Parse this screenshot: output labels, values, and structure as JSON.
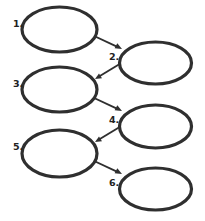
{
  "diagram": {
    "type": "flowchart",
    "background_color": "#ffffff",
    "shape_fill": "#ffffff",
    "shape_stroke": "#2f2f2f",
    "arrow_color": "#2f2f2f",
    "label_color": "#222222",
    "nodes": [
      {
        "id": "node-1",
        "label": "1.",
        "text": "",
        "cx": 59.5,
        "cy": 29.5,
        "rx": 37.5,
        "ry": 22.5,
        "label_x": 13,
        "label_y": 27,
        "column": "left"
      },
      {
        "id": "node-2",
        "label": "2.",
        "text": "",
        "cx": 155.5,
        "cy": 63.0,
        "rx": 36.0,
        "ry": 21.0,
        "label_x": 109,
        "label_y": 60,
        "column": "right"
      },
      {
        "id": "node-3",
        "label": "3.",
        "text": "",
        "cx": 59.5,
        "cy": 89.5,
        "rx": 37.5,
        "ry": 22.5,
        "label_x": 13,
        "label_y": 87,
        "column": "left"
      },
      {
        "id": "node-4",
        "label": "4.",
        "text": "",
        "cx": 155.5,
        "cy": 126.5,
        "rx": 36.0,
        "ry": 21.5,
        "label_x": 109,
        "label_y": 123,
        "column": "right"
      },
      {
        "id": "node-5",
        "label": "5.",
        "text": "",
        "cx": 59.5,
        "cy": 153.5,
        "rx": 37.5,
        "ry": 23.5,
        "label_x": 13,
        "label_y": 150,
        "column": "left"
      },
      {
        "id": "node-6",
        "label": "6.",
        "text": "",
        "cx": 155.5,
        "cy": 189.0,
        "rx": 36.0,
        "ry": 21.0,
        "label_x": 109,
        "label_y": 186,
        "column": "right"
      }
    ],
    "arrows": [
      {
        "id": "arrow-1-2",
        "from": "node-1",
        "to": "node-2",
        "x1": 92,
        "y1": 35,
        "x2": 122,
        "y2": 49,
        "direction": "down-right"
      },
      {
        "id": "arrow-2-3",
        "from": "node-2",
        "to": "node-3",
        "x1": 123,
        "y1": 62,
        "x2": 95,
        "y2": 79,
        "direction": "down-left"
      },
      {
        "id": "arrow-3-4",
        "from": "node-3",
        "to": "node-4",
        "x1": 92,
        "y1": 97,
        "x2": 122,
        "y2": 111,
        "direction": "down-right"
      },
      {
        "id": "arrow-4-5",
        "from": "node-4",
        "to": "node-5",
        "x1": 123,
        "y1": 125,
        "x2": 95,
        "y2": 142,
        "direction": "down-left"
      },
      {
        "id": "arrow-5-6",
        "from": "node-5",
        "to": "node-6",
        "x1": 92,
        "y1": 160,
        "x2": 122,
        "y2": 174,
        "direction": "down-right"
      }
    ]
  }
}
